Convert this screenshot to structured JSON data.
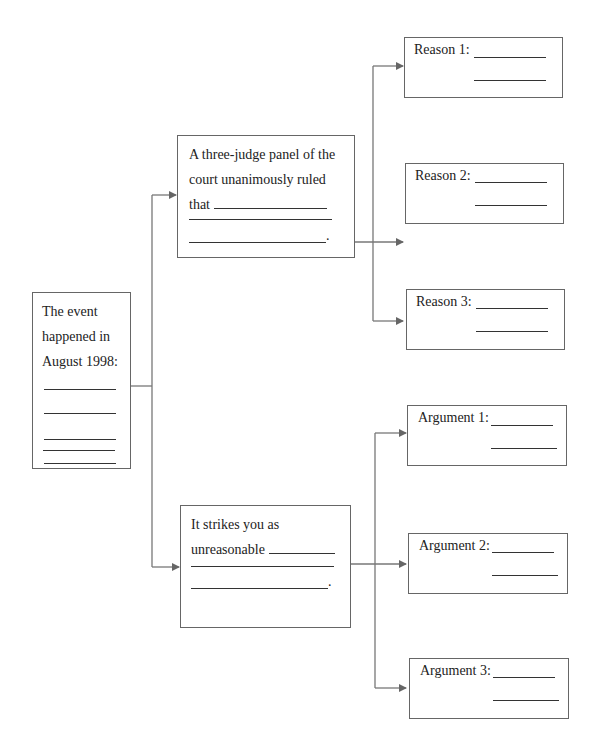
{
  "diagram": {
    "type": "graphic-organizer-tree",
    "colors": {
      "line": "#666666",
      "text": "#222222",
      "background": "#ffffff"
    },
    "root": {
      "lines": [
        "The event",
        "happened in",
        "August 1998:"
      ],
      "blank_count": 4
    },
    "branches": [
      {
        "text_lines": [
          "A three-judge panel of the",
          "court unanimously ruled",
          "that"
        ],
        "end_punct": ".",
        "children": [
          {
            "label": "Reason 1:"
          },
          {
            "label": "Reason 2:"
          },
          {
            "label": "Reason 3:"
          }
        ]
      },
      {
        "text_lines": [
          "It strikes you as",
          "unreasonable"
        ],
        "end_punct": ".",
        "children": [
          {
            "label": "Argument 1:"
          },
          {
            "label": "Argument 2:"
          },
          {
            "label": "Argument 3:"
          }
        ]
      }
    ]
  }
}
